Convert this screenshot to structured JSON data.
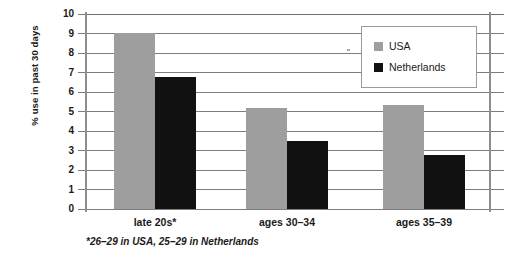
{
  "chart_data": {
    "type": "bar",
    "title": "",
    "xlabel": "",
    "ylabel": "% use in past 30 days",
    "ylim": [
      0,
      10
    ],
    "ytick_labels": [
      "10",
      "9",
      "8",
      "7",
      "6",
      "5",
      "4",
      "3",
      "2",
      "1",
      "0"
    ],
    "ytick_values": [
      10,
      9,
      8,
      7,
      6,
      5,
      4,
      3,
      2,
      1,
      0
    ],
    "grid": true,
    "legend_position": "top-right",
    "categories": [
      "late 20s*",
      "ages 30–34",
      "ages 35–39"
    ],
    "series": [
      {
        "name": "USA",
        "color": "#9e9e9e",
        "values": [
          9.05,
          5.2,
          5.35
        ]
      },
      {
        "name": "Netherlands",
        "color": "#111111",
        "values": [
          6.75,
          3.5,
          2.75
        ]
      }
    ],
    "footnote": "*26–29 in USA, 25–29 in Netherlands"
  },
  "legend": {
    "entries": [
      {
        "label": "USA",
        "swatch": "usa"
      },
      {
        "label": "Netherlands",
        "swatch": "nl"
      }
    ]
  },
  "colors": {
    "usa": "#9e9e9e",
    "netherlands": "#111111",
    "grid": "#7d7d7d",
    "axis": "#8d8d8d",
    "background": "#ffffff",
    "text": "#1a1a1a"
  }
}
